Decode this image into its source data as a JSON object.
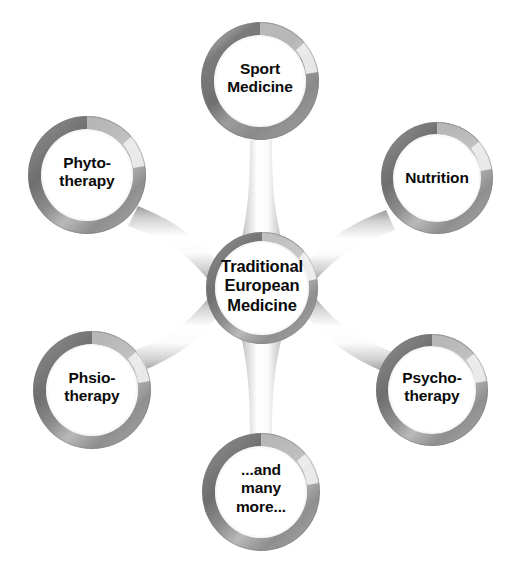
{
  "diagram": {
    "type": "hub-and-spoke radial diagram",
    "background_color": "#ffffff",
    "text_color": "#0a0a0a",
    "ring_colors": {
      "dark": "#6f6f6f",
      "mid": "#9a9a9a",
      "light": "#c9c9c9",
      "highlight": "#f2f2f2",
      "spoke": "#d8d8d8"
    },
    "hub": {
      "label": "Traditional\nEuropean\nMedicine",
      "cx": 262,
      "cy": 288,
      "r_outer": 56,
      "r_inner": 47
    },
    "satellites": [
      {
        "key": "sport-medicine",
        "label": "Sport\nMedicine",
        "cx": 260,
        "cy": 81,
        "r_outer": 59,
        "r_inner": 46
      },
      {
        "key": "phytotherapy",
        "label": "Phyto-\ntherapy",
        "cx": 87,
        "cy": 175,
        "r_outer": 59,
        "r_inner": 46
      },
      {
        "key": "nutrition",
        "label": "Nutrition",
        "cx": 437,
        "cy": 178,
        "r_outer": 56,
        "r_inner": 44
      },
      {
        "key": "phsiotherapy",
        "label": "Phsio-\ntherapy",
        "cx": 92,
        "cy": 390,
        "r_outer": 59,
        "r_inner": 46
      },
      {
        "key": "psychotherapy",
        "label": "Psycho-\ntherapy",
        "cx": 432,
        "cy": 390,
        "r_outer": 56,
        "r_inner": 44
      },
      {
        "key": "and-many-more",
        "label": "...and\nmany\nmore...",
        "cx": 261,
        "cy": 492,
        "r_outer": 59,
        "r_inner": 46
      }
    ],
    "connectors": [
      {
        "key": "hub-to-sport-medicine",
        "from": "hub",
        "to": "sport-medicine"
      },
      {
        "key": "hub-to-phytotherapy",
        "from": "hub",
        "to": "phytotherapy"
      },
      {
        "key": "hub-to-nutrition",
        "from": "hub",
        "to": "nutrition"
      },
      {
        "key": "hub-to-phsiotherapy",
        "from": "hub",
        "to": "phsiotherapy"
      },
      {
        "key": "hub-to-psychotherapy",
        "from": "hub",
        "to": "psychotherapy"
      },
      {
        "key": "hub-to-and-many-more",
        "from": "hub",
        "to": "and-many-more"
      }
    ]
  }
}
